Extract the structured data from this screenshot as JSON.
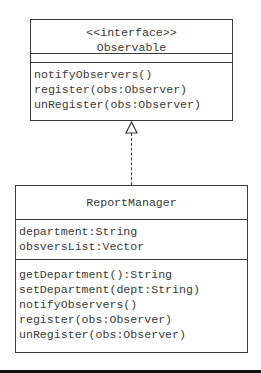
{
  "diagram": {
    "type": "UML class diagram",
    "relationship": "realization",
    "interface": {
      "stereotype": "<<interface>>",
      "name": "Observable",
      "attributes": [],
      "operations": [
        "notifyObservers()",
        "register(obs:Observer)",
        "unRegister(obs:Observer)"
      ]
    },
    "class": {
      "name": "ReportManager",
      "attributes": [
        "department:String",
        "obsversList:Vector"
      ],
      "operations": [
        "getDepartment():String",
        "setDepartment(dept:String)",
        "notifyObservers()",
        "register(obs:Observer)",
        "unRegister(obs:Observer)"
      ]
    }
  }
}
